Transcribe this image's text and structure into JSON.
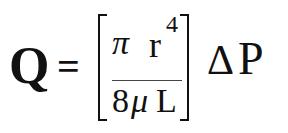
{
  "formula": {
    "description": "Poiseuille's law for volumetric flow rate",
    "lhs": "Q",
    "equals": "=",
    "numerator": {
      "pi": "π",
      "r": "r",
      "exponent": "4"
    },
    "denominator": {
      "eight": "8",
      "mu": "μ",
      "L": "L"
    },
    "delta": "Δ",
    "P": "P"
  }
}
